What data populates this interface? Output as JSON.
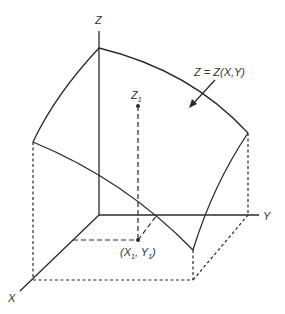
{
  "diagram": {
    "type": "3d-surface-axes",
    "axes": {
      "x_label": "X",
      "y_label": "Y",
      "z_label": "Z"
    },
    "surface_label": "Z = Z(X,Y)",
    "point_z": {
      "base": "Z",
      "subscript": "1"
    },
    "point_xy": {
      "open": "(",
      "x_base": "X",
      "x_sub": "1",
      "sep": ", ",
      "y_base": "Y",
      "y_sub": "1",
      "close": ")"
    },
    "colors": {
      "line": "#2a2a2a",
      "text": "#333333",
      "background": "#ffffff"
    }
  }
}
